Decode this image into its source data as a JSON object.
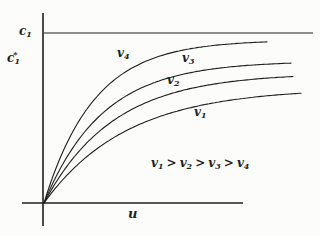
{
  "meta": {
    "background": "#fcfcfa",
    "ink": "#1f1f1f"
  },
  "labels": {
    "c1": {
      "base": "c",
      "sub": "1"
    },
    "c1_star": {
      "base": "c",
      "sup": "*",
      "sub": "1"
    },
    "u": {
      "base": "u"
    },
    "curve_labels": {
      "v1": {
        "base": "v",
        "sub": "1"
      },
      "v2": {
        "base": "v",
        "sub": "2"
      },
      "v3": {
        "base": "v",
        "sub": "3"
      },
      "v4": {
        "base": "v",
        "sub": "4"
      }
    },
    "ordering": {
      "t1": {
        "base": "v",
        "sub": "1"
      },
      "op1": ">",
      "t2": {
        "base": "v",
        "sub": "2"
      },
      "op2": ">",
      "t3": {
        "base": "v",
        "sub": "3"
      },
      "op3": ">",
      "t4": {
        "base": "v",
        "sub": "4"
      }
    }
  },
  "chart_data": {
    "type": "line",
    "title": "",
    "xlabel": "u",
    "ylabel": "c*1",
    "asymptote_label": "c1",
    "annotation": "v1 > v2 > v3 > v4",
    "axes_numeric": false,
    "grid": false,
    "x_normalized": [
      0,
      0.2,
      0.4,
      0.6,
      0.8,
      1.0
    ],
    "c1_level": 1.0,
    "series": [
      {
        "name": "v1",
        "asymptote_level": 0.68,
        "values_normalized": [
          0,
          0.31,
          0.48,
          0.57,
          0.62,
          0.65
        ]
      },
      {
        "name": "v2",
        "asymptote_level": 0.76,
        "values_normalized": [
          0,
          0.4,
          0.59,
          0.68,
          0.73,
          0.75
        ]
      },
      {
        "name": "v3",
        "asymptote_level": 0.84,
        "values_normalized": [
          0,
          0.49,
          0.69,
          0.77,
          0.81,
          0.83
        ]
      },
      {
        "name": "v4",
        "asymptote_level": 0.96,
        "values_normalized": [
          0,
          0.61,
          0.83,
          0.91,
          0.94,
          0.95
        ]
      }
    ],
    "layout": {
      "width": 320,
      "height": 236,
      "origin": {
        "x": 44,
        "y": 203
      },
      "y_axis": {
        "x": 43,
        "y_top": 13,
        "y_bottom": 226
      },
      "x_axis": {
        "y": 203,
        "x_left": 22,
        "x_right": 243
      },
      "asymptote": {
        "y": 33,
        "x_left": 44,
        "x_right": 313
      },
      "curves_px": [
        {
          "name": "v4",
          "A": 163,
          "tau": 50,
          "x_end": 268
        },
        {
          "name": "v3",
          "A": 142,
          "tau": 58.6,
          "x_end": 291
        },
        {
          "name": "v2",
          "A": 130,
          "tau": 69,
          "x_end": 293
        },
        {
          "name": "v1",
          "A": 115,
          "tau": 83,
          "x_end": 301
        }
      ]
    }
  }
}
